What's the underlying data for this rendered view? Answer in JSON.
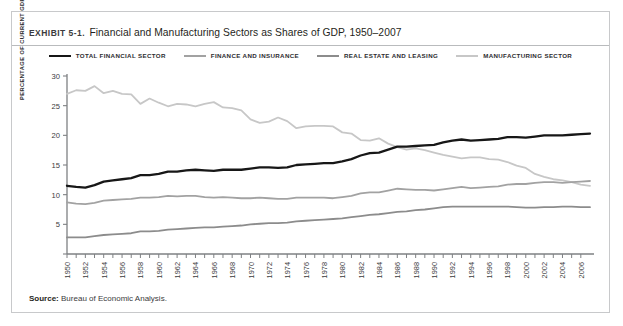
{
  "exhibit": {
    "label": "Exhibit 5-1.",
    "title": "Financial and Manufacturing Sectors as Shares of GDP, 1950–2007",
    "source_prefix": "Source:",
    "source_text": "Bureau of Economic Analysis."
  },
  "chart_data": {
    "type": "line",
    "title": "Financial and Manufacturing Sectors as Shares of GDP, 1950–2007",
    "xlabel": "",
    "ylabel": "Percentage of Current GDP",
    "ylim": [
      0,
      30
    ],
    "y_ticks": [
      0,
      5,
      10,
      15,
      20,
      25,
      30
    ],
    "y_tick_labels": [
      "",
      "5",
      "10",
      "15",
      "20",
      "25",
      "30"
    ],
    "xlim": [
      1950,
      2007
    ],
    "grid": false,
    "legend_position": "top-center",
    "x": [
      1950,
      1951,
      1952,
      1953,
      1954,
      1955,
      1956,
      1957,
      1958,
      1959,
      1960,
      1961,
      1962,
      1963,
      1964,
      1965,
      1966,
      1967,
      1968,
      1969,
      1970,
      1971,
      1972,
      1973,
      1974,
      1975,
      1976,
      1977,
      1978,
      1979,
      1980,
      1981,
      1982,
      1983,
      1984,
      1985,
      1986,
      1987,
      1988,
      1989,
      1990,
      1991,
      1992,
      1993,
      1994,
      1995,
      1996,
      1997,
      1998,
      1999,
      2000,
      2001,
      2002,
      2003,
      2004,
      2005,
      2006,
      2007
    ],
    "x_tick_labels": [
      "1950",
      "1952",
      "1954",
      "1956",
      "1958",
      "1960",
      "1962",
      "1964",
      "1966",
      "1968",
      "1970",
      "1972",
      "1974",
      "1976",
      "1978",
      "1980",
      "1982",
      "1984",
      "1986",
      "1988",
      "1990",
      "1992",
      "1994",
      "1996",
      "1998",
      "2000",
      "2002",
      "2004",
      "2006"
    ],
    "series": [
      {
        "name": "Total Financial Sector",
        "color": "#171717",
        "width": 2.3,
        "values": [
          11.5,
          11.3,
          11.2,
          11.6,
          12.2,
          12.4,
          12.6,
          12.8,
          13.3,
          13.3,
          13.5,
          13.9,
          13.9,
          14.1,
          14.2,
          14.1,
          14.0,
          14.2,
          14.2,
          14.2,
          14.4,
          14.6,
          14.6,
          14.5,
          14.6,
          15.0,
          15.1,
          15.2,
          15.3,
          15.3,
          15.6,
          16.0,
          16.6,
          17.0,
          17.1,
          17.6,
          18.1,
          18.1,
          18.2,
          18.3,
          18.4,
          18.8,
          19.1,
          19.3,
          19.1,
          19.2,
          19.3,
          19.4,
          19.7,
          19.7,
          19.6,
          19.8,
          20.0,
          20.0,
          20.0,
          20.1,
          20.2,
          20.3
        ]
      },
      {
        "name": "Finance and Insurance",
        "color": "#a2a2a2",
        "width": 1.8,
        "values": [
          8.7,
          8.5,
          8.4,
          8.6,
          9.0,
          9.1,
          9.2,
          9.3,
          9.5,
          9.5,
          9.6,
          9.8,
          9.7,
          9.8,
          9.8,
          9.6,
          9.5,
          9.6,
          9.5,
          9.4,
          9.4,
          9.5,
          9.4,
          9.3,
          9.3,
          9.5,
          9.5,
          9.5,
          9.5,
          9.4,
          9.6,
          9.8,
          10.2,
          10.4,
          10.4,
          10.7,
          11.0,
          10.9,
          10.8,
          10.8,
          10.7,
          10.9,
          11.1,
          11.3,
          11.1,
          11.2,
          11.3,
          11.4,
          11.7,
          11.8,
          11.8,
          12.0,
          12.1,
          12.1,
          12.0,
          12.1,
          12.2,
          12.3
        ]
      },
      {
        "name": "Real Estate and Leasing",
        "color": "#8c8c8c",
        "width": 1.8,
        "values": [
          2.8,
          2.8,
          2.8,
          3.0,
          3.2,
          3.3,
          3.4,
          3.5,
          3.8,
          3.8,
          3.9,
          4.1,
          4.2,
          4.3,
          4.4,
          4.5,
          4.5,
          4.6,
          4.7,
          4.8,
          5.0,
          5.1,
          5.2,
          5.2,
          5.3,
          5.5,
          5.6,
          5.7,
          5.8,
          5.9,
          6.0,
          6.2,
          6.4,
          6.6,
          6.7,
          6.9,
          7.1,
          7.2,
          7.4,
          7.5,
          7.7,
          7.9,
          8.0,
          8.0,
          8.0,
          8.0,
          8.0,
          8.0,
          8.0,
          7.9,
          7.8,
          7.8,
          7.9,
          7.9,
          8.0,
          8.0,
          7.9,
          7.9
        ]
      },
      {
        "name": "Manufacturing Sector",
        "color": "#c7c7c7",
        "width": 1.8,
        "values": [
          27.0,
          27.6,
          27.5,
          28.3,
          27.1,
          27.5,
          27.0,
          26.9,
          25.3,
          26.2,
          25.5,
          24.9,
          25.3,
          25.2,
          24.9,
          25.3,
          25.6,
          24.7,
          24.6,
          24.2,
          22.7,
          22.1,
          22.3,
          23.0,
          22.4,
          21.2,
          21.5,
          21.6,
          21.6,
          21.5,
          20.5,
          20.3,
          19.2,
          19.1,
          19.5,
          18.6,
          18.0,
          17.6,
          17.8,
          17.5,
          17.1,
          16.7,
          16.4,
          16.1,
          16.3,
          16.3,
          16.0,
          15.9,
          15.5,
          14.9,
          14.5,
          13.5,
          13.0,
          12.6,
          12.4,
          12.1,
          11.7,
          11.5
        ]
      }
    ]
  }
}
